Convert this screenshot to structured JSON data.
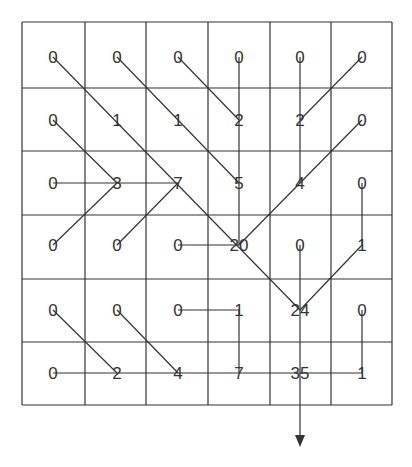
{
  "grid": {
    "rows": 6,
    "cols": 6,
    "values": [
      [
        "0",
        "0",
        "0",
        "0",
        "0",
        "0"
      ],
      [
        "0",
        "1",
        "1",
        "2",
        "2",
        "0"
      ],
      [
        "0",
        "3",
        "7",
        "5",
        "4",
        "0"
      ],
      [
        "0",
        "0",
        "0",
        "20",
        "0",
        "1"
      ],
      [
        "0",
        "0",
        "0",
        "1",
        "24",
        "0"
      ],
      [
        "0",
        "2",
        "4",
        "7",
        "35",
        "1"
      ]
    ]
  },
  "layout": {
    "col_lines": [
      22,
      85,
      146,
      208,
      270,
      331,
      392
    ],
    "row_lines": [
      22,
      88,
      151,
      215,
      279,
      342,
      405
    ],
    "col_centers": [
      53,
      117,
      178,
      239,
      300,
      362
    ],
    "row_centers": [
      57,
      120,
      183,
      245,
      310,
      373
    ]
  },
  "connections": [
    {
      "from": [
        0,
        0
      ],
      "to": [
        4,
        4
      ]
    },
    {
      "from": [
        0,
        1
      ],
      "to": [
        2,
        3
      ]
    },
    {
      "from": [
        0,
        2
      ],
      "to": [
        1,
        3
      ]
    },
    {
      "from": [
        0,
        3
      ],
      "to": [
        3,
        3
      ]
    },
    {
      "from": [
        0,
        4
      ],
      "to": [
        2,
        4
      ]
    },
    {
      "from": [
        0,
        5
      ],
      "to": [
        1,
        4
      ]
    },
    {
      "from": [
        1,
        0
      ],
      "to": [
        2,
        1
      ]
    },
    {
      "from": [
        1,
        5
      ],
      "to": [
        3,
        3
      ]
    },
    {
      "from": [
        2,
        0
      ],
      "to": [
        2,
        2
      ]
    },
    {
      "from": [
        3,
        0
      ],
      "to": [
        2,
        1
      ]
    },
    {
      "from": [
        3,
        1
      ],
      "to": [
        2,
        2
      ]
    },
    {
      "from": [
        3,
        2
      ],
      "to": [
        3,
        3
      ]
    },
    {
      "from": [
        2,
        5
      ],
      "to": [
        3,
        5
      ]
    },
    {
      "from": [
        3,
        5
      ],
      "to": [
        4,
        4
      ]
    },
    {
      "from": [
        4,
        0
      ],
      "to": [
        5,
        1
      ]
    },
    {
      "from": [
        4,
        1
      ],
      "to": [
        5,
        2
      ]
    },
    {
      "from": [
        4,
        2
      ],
      "to": [
        4,
        3
      ]
    },
    {
      "from": [
        4,
        3
      ],
      "to": [
        5,
        3
      ]
    },
    {
      "from": [
        4,
        5
      ],
      "to": [
        5,
        5
      ]
    },
    {
      "from": [
        5,
        0
      ],
      "to": [
        5,
        5
      ]
    }
  ],
  "output_arrow": {
    "column": 4,
    "from_row": 3,
    "end_y": 447
  },
  "colors": {
    "line": "#333333",
    "text": "#333333",
    "background": "#ffffff"
  }
}
